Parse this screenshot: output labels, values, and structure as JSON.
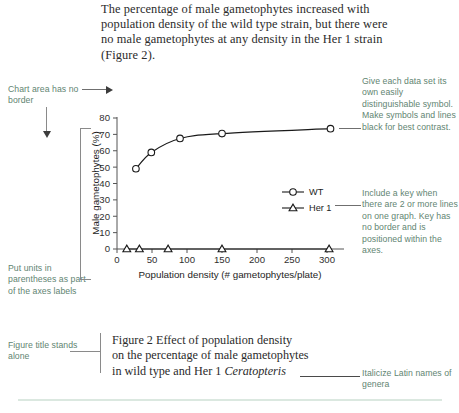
{
  "intro": {
    "paragraph": "The percentage of male gametophytes increased with population density of the wild type strain, but there were no male gametophytes at any density in the Her 1 strain (Figure 2)."
  },
  "annotations": {
    "chart_border": "Chart area has no border",
    "symbols": "Give each data set its own easily distinguishable symbol. Make symbols and lines black for best contrast.",
    "key": "Include a key when there are 2 or more lines on one graph. Key has no border and is positioned within the axes.",
    "units": "Put units in parentheses as part of the axes labels",
    "title_alone": "Figure title stands alone",
    "italics": "Italicize Latin names of genera"
  },
  "caption": {
    "line1": "Figure 2  Effect of population density",
    "line2": "on the percentage of male gametophytes",
    "line3_pre": "in wild type and Her 1 ",
    "line3_italic": "Ceratopteris"
  },
  "colors": {
    "annotation": "#5f8572",
    "data": "#1a1a1a",
    "axis": "#555555",
    "rule": "#dbe8e0"
  },
  "chart_data": {
    "type": "line",
    "title": "",
    "xlabel": "Population density (# gametophytes/plate)",
    "ylabel": "Male gametophytes (%)",
    "xlim": [
      0,
      320
    ],
    "ylim": [
      0,
      80
    ],
    "xticks": [
      0,
      50,
      100,
      150,
      200,
      250,
      300
    ],
    "yticks": [
      0,
      10,
      20,
      30,
      40,
      50,
      60,
      70,
      80
    ],
    "xtick_labels": [
      "0",
      "50",
      "100",
      "150",
      "200",
      "250",
      "300"
    ],
    "ytick_labels": [
      "0",
      "10",
      "20",
      "30",
      "40",
      "50",
      "60",
      "70",
      "80"
    ],
    "grid": false,
    "legend_position": "inside-right",
    "series": [
      {
        "name": "WT",
        "marker": "circle",
        "x": [
          27,
          49,
          90,
          150,
          305
        ],
        "y": [
          49,
          59,
          67.5,
          70.5,
          73.5
        ]
      },
      {
        "name": "Her 1",
        "marker": "triangle",
        "x": [
          14,
          32,
          73,
          150,
          303
        ],
        "y": [
          0,
          0,
          0,
          0,
          0
        ]
      }
    ]
  }
}
